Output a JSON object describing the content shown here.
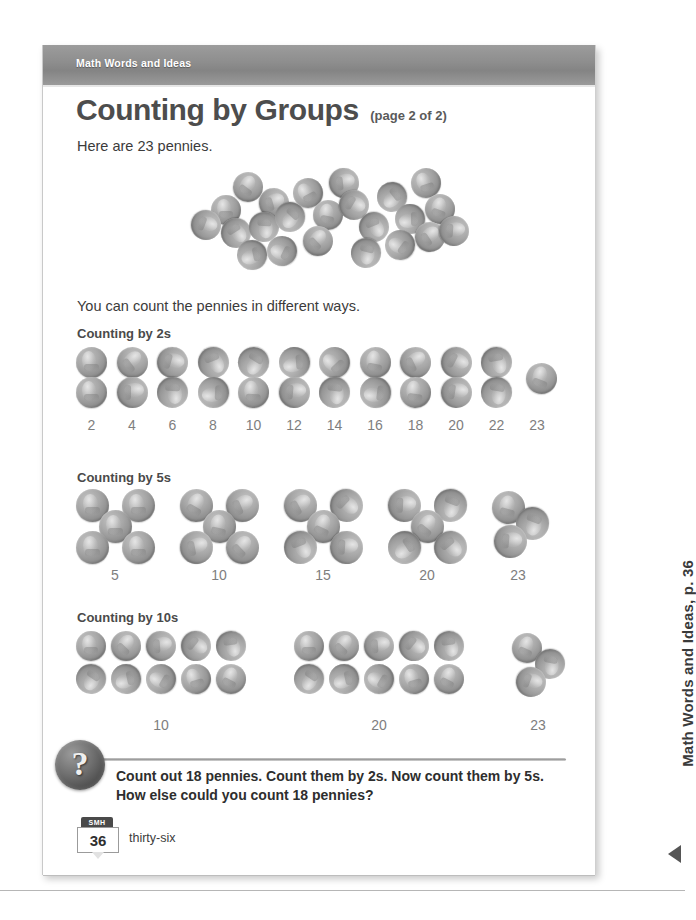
{
  "document": {
    "header_label": "Math Words and Ideas",
    "title": "Counting by Groups",
    "title_note": "(page 2 of 2)",
    "intro": "Here are 23 pennies.",
    "lead": "You can count the pennies in different ways.",
    "pile_count": 23
  },
  "sections": [
    {
      "heading": "Counting by 2s",
      "group_size": 2,
      "labels": [
        "2",
        "4",
        "6",
        "8",
        "10",
        "12",
        "14",
        "16",
        "18",
        "20",
        "22",
        "23"
      ],
      "group_counts": [
        2,
        2,
        2,
        2,
        2,
        2,
        2,
        2,
        2,
        2,
        2,
        1
      ]
    },
    {
      "heading": "Counting by 5s",
      "group_size": 5,
      "labels": [
        "5",
        "10",
        "15",
        "20",
        "23"
      ],
      "group_counts": [
        5,
        5,
        5,
        5,
        3
      ]
    },
    {
      "heading": "Counting by 10s",
      "group_size": 10,
      "labels": [
        "10",
        "20",
        "23"
      ],
      "group_counts": [
        10,
        10,
        3
      ]
    }
  ],
  "question": {
    "icon": "question-mark-icon",
    "text": "Count out 18 pennies. Count them by 2s. Now count them by 5s. How else could you count 18 pennies?"
  },
  "footer": {
    "badge_label": "SMH",
    "page_number": "36",
    "page_word": "thirty-six"
  },
  "margin": {
    "label": "Math Words and Ideas, p. 36",
    "marker": "left-triangle-icon"
  },
  "colors": {
    "header_bar": "#8e8e8e",
    "title": "#4d4d4d",
    "body_text": "#3b3b3b",
    "number_label": "#7e7e7e",
    "coin": "#a0a0a0",
    "page_background": "#ffffff"
  }
}
